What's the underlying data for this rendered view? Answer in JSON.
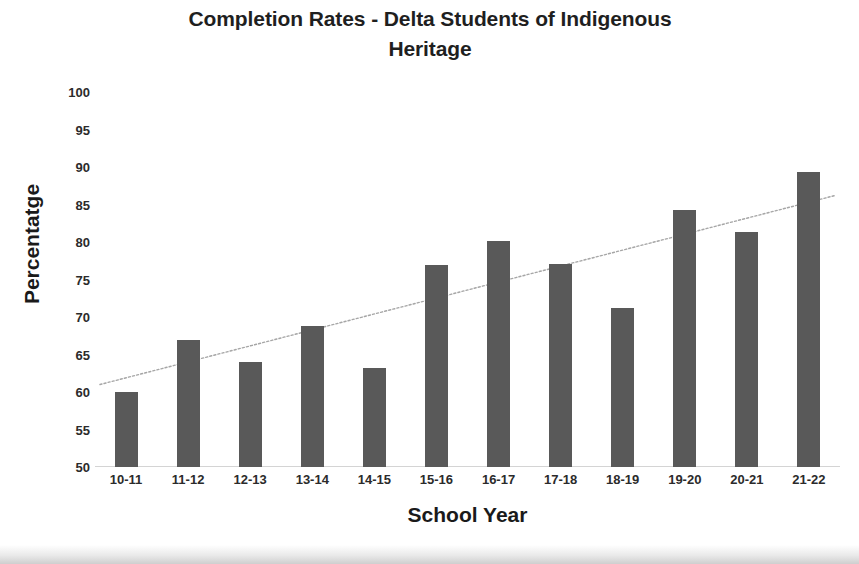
{
  "chart_data": {
    "type": "bar",
    "title": "Completion Rates - Delta Students of Indigenous Heritage",
    "title_line1": "Completion Rates - Delta Students of Indigenous",
    "title_line2": "Heritage",
    "xlabel": "School Year",
    "ylabel": "Percentatge",
    "categories": [
      "10-11",
      "11-12",
      "12-13",
      "13-14",
      "14-15",
      "15-16",
      "16-17",
      "17-18",
      "18-19",
      "19-20",
      "20-21",
      "21-22"
    ],
    "values": [
      60.0,
      67.0,
      64.0,
      68.8,
      63.2,
      77.0,
      80.2,
      77.1,
      71.2,
      84.3,
      81.3,
      89.3
    ],
    "ylim": [
      50,
      100
    ],
    "ytick_labels": [
      "100",
      "95",
      "90",
      "85",
      "80",
      "75",
      "70",
      "65",
      "60",
      "55",
      "50"
    ],
    "yticks": [
      100,
      95,
      90,
      85,
      80,
      75,
      70,
      65,
      60,
      55,
      50
    ],
    "grid": false,
    "legend": "none",
    "series": [
      {
        "name": "Completion Rate",
        "values": [
          60.0,
          67.0,
          64.0,
          68.8,
          63.2,
          77.0,
          80.2,
          77.1,
          71.2,
          84.3,
          81.3,
          89.3
        ],
        "color": "#595959"
      }
    ],
    "trendline": {
      "type": "linear",
      "start_value": 61.0,
      "end_value": 86.2,
      "color": "#a6a6a6",
      "style": "dotted"
    },
    "colors": {
      "bar": "#595959",
      "trendline": "#a6a6a6",
      "axis": "#d4d4d4",
      "text": "#262626",
      "background": "#ffffff"
    }
  }
}
